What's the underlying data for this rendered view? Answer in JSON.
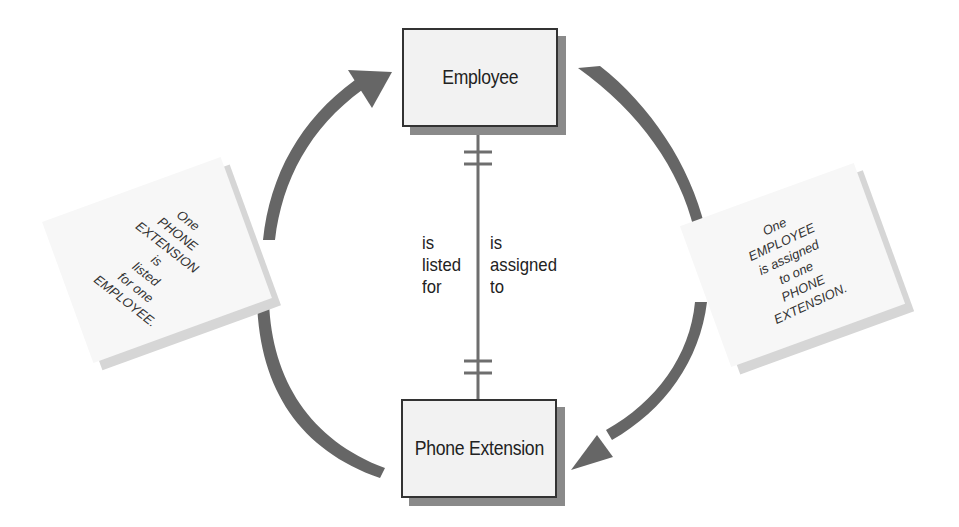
{
  "diagram": {
    "type": "entity-relationship",
    "entities": [
      {
        "id": "employee",
        "label": "Employee"
      },
      {
        "id": "phone_extension",
        "label": "Phone Extension"
      }
    ],
    "relationship": {
      "cardinality": "one-to-one",
      "left_label": [
        "is",
        "listed",
        "for"
      ],
      "right_label": [
        "is",
        "assigned",
        "to"
      ]
    },
    "notes": {
      "left": [
        "One",
        "PHONE",
        "EXTENSION",
        "is",
        "listed",
        "for one",
        "EMPLOYEE."
      ],
      "right": [
        "One",
        "EMPLOYEE",
        "is assigned",
        "to one",
        "PHONE",
        "EXTENSION."
      ]
    },
    "colors": {
      "arrow": "#666666",
      "entity_fill": "#f2f2f2",
      "entity_border": "#333333",
      "shadow": "#8a8a8a",
      "line": "#6e6e6e"
    }
  }
}
